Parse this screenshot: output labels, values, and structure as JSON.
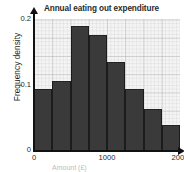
{
  "figure": {
    "top_artifact_text": "",
    "x_axis_title_clipped": "Amount (£)"
  },
  "chart_data": {
    "type": "bar",
    "title": "Annual eating out expenditure",
    "xlabel": "Amount (£)",
    "ylabel": "Frequency density",
    "grid": true,
    "legend": "none",
    "xlim": [
      0,
      2000
    ],
    "ylim": [
      0,
      0.2
    ],
    "xticks": [
      0,
      1000,
      2000
    ],
    "xtick_labels": [
      "0",
      "1000",
      "2000"
    ],
    "yticks": [
      0,
      0.1,
      0.2
    ],
    "ytick_labels": [
      "0",
      "0.1",
      "0.2"
    ],
    "bin_edges": [
      0,
      250,
      500,
      750,
      1000,
      1250,
      1500,
      1750,
      2000
    ],
    "categories": [
      "0-250",
      "250-500",
      "500-750",
      "750-1000",
      "1000-1250",
      "1250-1500",
      "1500-1750",
      "1750-2000"
    ],
    "values": [
      0.093,
      0.105,
      0.19,
      0.175,
      0.134,
      0.093,
      0.062,
      0.038
    ],
    "bar_color": "#3a3a3a",
    "plot_background": "#f4f4f4"
  }
}
